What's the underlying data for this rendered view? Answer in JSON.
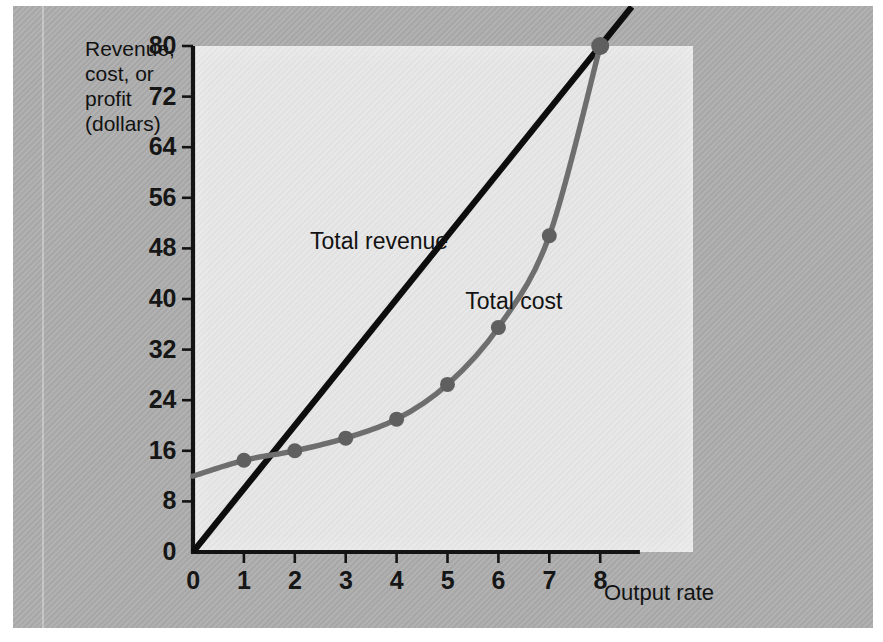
{
  "figure": {
    "background_color": "#adadad",
    "plot_background_color": "#e6e6e6"
  },
  "chart_data": {
    "type": "line",
    "title": "",
    "subtitle": "",
    "xlabel": "Output rate",
    "ylabel": "Revenue, cost, or profit (dollars)",
    "ylabel_lines": "Revenue,\ncost, or\nprofit\n(dollars)",
    "xlim": [
      0,
      8.6
    ],
    "ylim": [
      0,
      80
    ],
    "xticks": [
      0,
      1,
      2,
      3,
      4,
      5,
      6,
      7,
      8
    ],
    "xtick_labels": [
      "0",
      "1",
      "2",
      "3",
      "4",
      "5",
      "6",
      "7",
      "8"
    ],
    "yticks": [
      0,
      8,
      16,
      24,
      32,
      40,
      48,
      56,
      64,
      72,
      80
    ],
    "ytick_labels": [
      "0",
      "8",
      "16",
      "24",
      "32",
      "40",
      "48",
      "56",
      "64",
      "72",
      "80"
    ],
    "grid": false,
    "legend": "inline-annotations",
    "series": [
      {
        "name": "Total revenue",
        "type": "line",
        "color": "#0d0d0d",
        "markers": false,
        "x": [
          0,
          8
        ],
        "values": [
          0,
          80
        ],
        "slope_dollars_per_unit": 10,
        "annotation": {
          "text": "Total revenue",
          "x": 2.3,
          "y": 49
        }
      },
      {
        "name": "Total cost",
        "type": "line",
        "color": "#6e6e6e",
        "markers": true,
        "x": [
          0,
          1,
          2,
          3,
          4,
          5,
          6,
          7,
          8
        ],
        "values": [
          12,
          14.5,
          16,
          18,
          21,
          26.5,
          35.5,
          50,
          80
        ],
        "annotation": {
          "text": "Total cost",
          "x": 5.35,
          "y": 39.5
        }
      }
    ],
    "breakeven_points": [
      {
        "x": 1.6,
        "y": 16
      },
      {
        "x": 8.0,
        "y": 80
      }
    ]
  },
  "annotations": {
    "total_revenue_label": "Total revenue",
    "total_cost_label": "Total cost"
  }
}
